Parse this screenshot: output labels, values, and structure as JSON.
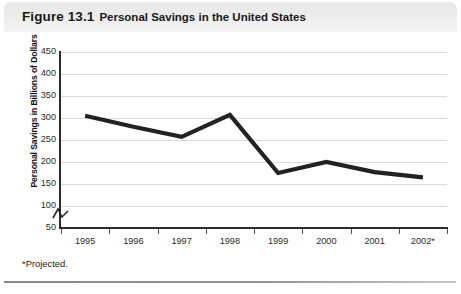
{
  "figure": {
    "number": "Figure 13.1",
    "title": "Personal Savings in the United States",
    "footnote": "*Projected."
  },
  "chart_data": {
    "type": "line",
    "title": "Personal Savings in the United States",
    "xlabel": "",
    "ylabel": "Personal Savings in Billions of Dollars",
    "categories": [
      "1995",
      "1996",
      "1997",
      "1998",
      "1999",
      "2000",
      "2001",
      "2002*"
    ],
    "values": [
      305,
      280,
      257,
      307,
      175,
      200,
      177,
      165
    ],
    "series": [
      {
        "name": "Personal Savings",
        "values": [
          305,
          280,
          257,
          307,
          175,
          200,
          177,
          165
        ],
        "color": "#222222"
      }
    ],
    "ylim": [
      50,
      450
    ],
    "yticks": [
      50,
      100,
      150,
      200,
      250,
      300,
      350,
      400,
      450
    ],
    "ytick_labels": [
      "50",
      "100",
      "150",
      "200",
      "250",
      "300",
      "350",
      "400",
      "450"
    ],
    "axis_break": true,
    "grid": true,
    "grid_axis": "y",
    "legend": "none",
    "line_color": "#222222",
    "grid_color": "#d9d9d9",
    "axis_color": "#2b2b2b"
  }
}
